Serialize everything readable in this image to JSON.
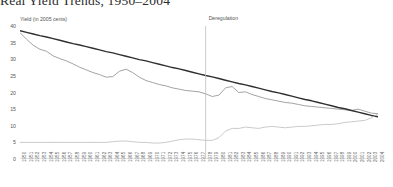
{
  "chart_data": {
    "type": "line",
    "title": "Real Yield Trends, 1950–2004",
    "xlabel": "",
    "ylabel": "Yield (in 2005 cents)",
    "ylim": [
      0,
      40
    ],
    "yticks": [
      0,
      5,
      10,
      15,
      20,
      25,
      30,
      35,
      40
    ],
    "grid": false,
    "legend_position": "none",
    "annotations": [
      {
        "label": "Deregulation",
        "type": "vline",
        "x": 1978
      }
    ],
    "x": [
      1950,
      1951,
      1952,
      1953,
      1954,
      1955,
      1956,
      1957,
      1958,
      1959,
      1960,
      1961,
      1962,
      1963,
      1964,
      1965,
      1966,
      1967,
      1968,
      1969,
      1970,
      1971,
      1972,
      1973,
      1974,
      1975,
      1976,
      1977,
      1978,
      1979,
      1980,
      1981,
      1982,
      1983,
      1984,
      1985,
      1986,
      1987,
      1988,
      1989,
      1990,
      1991,
      1992,
      1993,
      1994,
      1995,
      1996,
      1997,
      1998,
      1999,
      2000,
      2001,
      2002,
      2003,
      2004
    ],
    "categories": [
      "1950",
      "1951",
      "1952",
      "1953",
      "1954",
      "1955",
      "1956",
      "1957",
      "1958",
      "1959",
      "1960",
      "1961",
      "1962",
      "1963",
      "1964",
      "1965",
      "1966",
      "1967",
      "1968",
      "1969",
      "1970",
      "1971",
      "1972",
      "1973",
      "1974",
      "1975",
      "1976",
      "1977",
      "1978",
      "1979",
      "1980",
      "1981",
      "1982",
      "1983",
      "1984",
      "1985",
      "1986",
      "1987",
      "1988",
      "1989",
      "1990",
      "1991",
      "1992",
      "1993",
      "1994",
      "1995",
      "1996",
      "1997",
      "1998",
      "1999",
      "2000",
      "2001",
      "2002",
      "2003",
      "2004"
    ],
    "series": [
      {
        "name": "Real yield",
        "color": "#8c8c8c",
        "width": 0.8,
        "values": [
          38.0,
          36.0,
          34.2,
          33.0,
          32.4,
          31.0,
          30.2,
          29.5,
          28.6,
          27.6,
          26.8,
          26.0,
          25.4,
          24.6,
          24.8,
          26.4,
          27.0,
          26.0,
          24.6,
          23.6,
          23.0,
          22.4,
          22.0,
          21.4,
          21.0,
          20.6,
          20.4,
          20.2,
          19.6,
          18.8,
          19.2,
          21.4,
          21.8,
          20.0,
          20.2,
          19.4,
          18.8,
          18.2,
          17.8,
          17.4,
          17.0,
          16.8,
          16.4,
          16.0,
          15.8,
          15.6,
          15.4,
          15.2,
          15.0,
          14.8,
          14.6,
          15.0,
          14.4,
          13.8,
          13.6
        ]
      },
      {
        "name": "Trend line",
        "color": "#2f2f2f",
        "width": 1.4,
        "values": [
          38.6,
          38.1,
          37.6,
          37.1,
          36.7,
          36.2,
          35.7,
          35.2,
          34.7,
          34.3,
          33.8,
          33.3,
          32.8,
          32.3,
          31.9,
          31.4,
          30.9,
          30.4,
          29.9,
          29.5,
          29.0,
          28.5,
          28.0,
          27.5,
          27.1,
          26.6,
          26.1,
          25.6,
          25.1,
          24.7,
          24.2,
          23.7,
          23.2,
          22.7,
          22.3,
          21.8,
          21.3,
          20.8,
          20.3,
          19.9,
          19.4,
          18.9,
          18.4,
          17.9,
          17.5,
          17.0,
          16.5,
          16.0,
          15.5,
          15.1,
          14.6,
          14.1,
          13.6,
          13.1,
          12.7
        ]
      },
      {
        "name": "Lower series",
        "color": "#bdbdbd",
        "width": 0.8,
        "values": [
          5.0,
          5.0,
          5.0,
          5.0,
          5.0,
          5.0,
          5.0,
          5.0,
          5.0,
          5.0,
          5.0,
          5.0,
          5.0,
          5.0,
          5.2,
          5.4,
          5.4,
          5.2,
          5.0,
          5.0,
          4.8,
          4.8,
          5.0,
          5.4,
          5.8,
          6.0,
          6.0,
          5.8,
          5.6,
          5.6,
          6.4,
          8.4,
          9.2,
          9.2,
          9.6,
          9.4,
          9.2,
          9.6,
          9.8,
          9.6,
          9.4,
          9.6,
          9.8,
          9.8,
          10.0,
          10.2,
          10.4,
          10.4,
          10.6,
          11.0,
          11.2,
          11.4,
          11.6,
          12.4,
          13.6
        ]
      }
    ]
  }
}
